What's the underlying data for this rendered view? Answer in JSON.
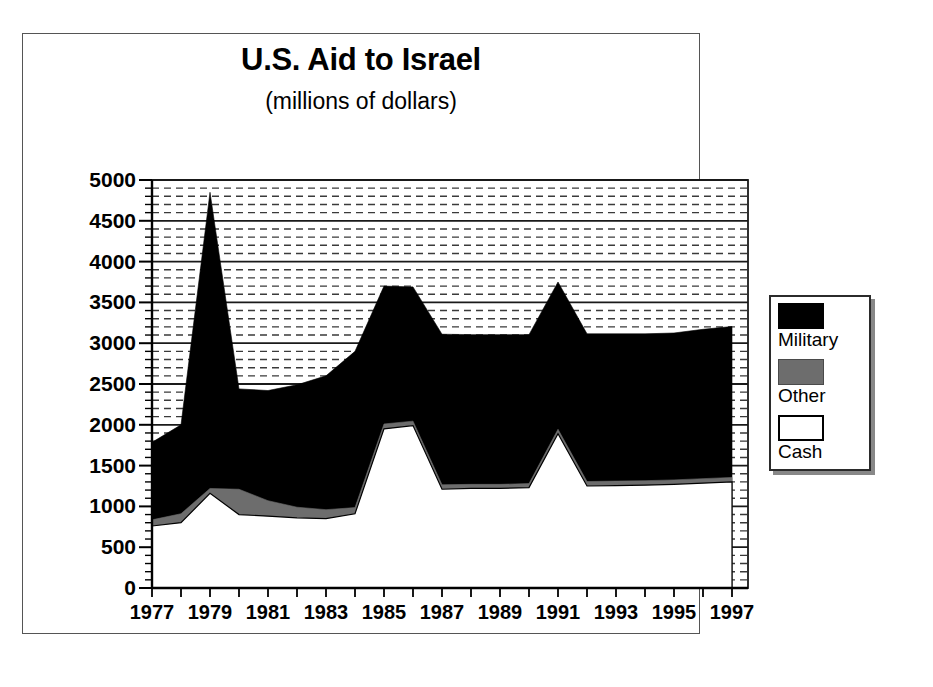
{
  "chart_data": {
    "type": "area",
    "title": "U.S. Aid to Israel",
    "subtitle": "(millions of dollars)",
    "xlabel": "",
    "ylabel": "",
    "stacked": true,
    "grid": true,
    "legend_position": "right-outside",
    "xlim": [
      1977,
      1997
    ],
    "ylim": [
      0,
      5000
    ],
    "ytick_step": 500,
    "yticks": [
      0,
      500,
      1000,
      1500,
      2000,
      2500,
      3000,
      3500,
      4000,
      4500,
      5000
    ],
    "ytick_labels": [
      "0",
      "500",
      "1000",
      "1500",
      "2000",
      "2500",
      "3000",
      "3500",
      "4000",
      "4500",
      "5000"
    ],
    "minor_gridlines_per_major": 5,
    "x": [
      1977,
      1978,
      1979,
      1980,
      1981,
      1982,
      1983,
      1984,
      1985,
      1986,
      1987,
      1988,
      1989,
      1990,
      1991,
      1992,
      1993,
      1994,
      1995,
      1996,
      1997
    ],
    "xtick_labels": [
      "1977",
      "1979",
      "1981",
      "1983",
      "1985",
      "1987",
      "1989",
      "1991",
      "1993",
      "1995",
      "1997"
    ],
    "xtick_label_years": [
      1977,
      1979,
      1981,
      1983,
      1985,
      1987,
      1989,
      1991,
      1993,
      1995,
      1997
    ],
    "series": [
      {
        "name": "Cash",
        "color": "#ffffff",
        "stack_order": 1,
        "values": [
          760,
          800,
          1160,
          900,
          880,
          860,
          850,
          910,
          1950,
          1990,
          1210,
          1220,
          1220,
          1230,
          1890,
          1250,
          1255,
          1260,
          1270,
          1285,
          1300
        ]
      },
      {
        "name": "Other",
        "color": "#6d6d6d",
        "stack_order": 2,
        "values": [
          75,
          110,
          60,
          310,
          190,
          130,
          110,
          75,
          60,
          55,
          55,
          50,
          50,
          50,
          55,
          55,
          55,
          55,
          55,
          55,
          55
        ]
      },
      {
        "name": "Military",
        "color": "#000000",
        "stack_order": 3,
        "values": [
          950,
          1090,
          3630,
          1230,
          1350,
          1500,
          1640,
          1915,
          1690,
          1645,
          1845,
          1835,
          1835,
          1825,
          1805,
          1810,
          1805,
          1800,
          1800,
          1830,
          1850
        ]
      }
    ],
    "totals": [
      1785,
      2000,
      4850,
      2440,
      2420,
      2490,
      2600,
      2900,
      3700,
      3690,
      3110,
      3105,
      3105,
      3105,
      3750,
      3115,
      3115,
      3115,
      3125,
      3170,
      3205
    ]
  },
  "legend": {
    "items": [
      {
        "label": "Military",
        "color": "#000000"
      },
      {
        "label": "Other",
        "color": "#6d6d6d"
      },
      {
        "label": "Cash",
        "color": "#ffffff"
      }
    ]
  }
}
